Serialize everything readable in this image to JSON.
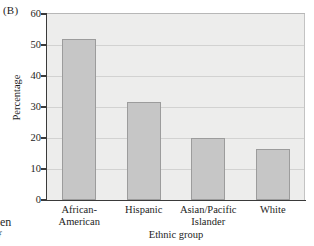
{
  "panel": {
    "label": "(B)"
  },
  "chart_data": {
    "type": "bar",
    "title": "(B)",
    "categories": [
      "African-American",
      "Hispanic",
      "Asian/Pacific Islander",
      "White"
    ],
    "values": [
      52,
      31.5,
      20,
      16.5
    ],
    "xlabel": "Ethnic group",
    "ylabel": "Percentage",
    "ylim": [
      0,
      60
    ],
    "ytick_labels": [
      "0",
      "10",
      "20",
      "30",
      "40",
      "50",
      "60"
    ],
    "ytick_values": [
      0,
      10,
      20,
      30,
      40,
      50,
      60
    ],
    "grid": "horizontal",
    "legend": "none",
    "bar_color": "#c6c6c6",
    "bar_edge_color": "#9c9c9c",
    "plot_background": "#ededec",
    "axis_color": "#3a3a3a",
    "gridline_color": "#d2d2d1"
  },
  "bleed": {
    "line1": "nen",
    "line2": "f"
  }
}
